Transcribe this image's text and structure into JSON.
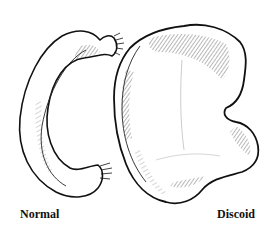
{
  "figure": {
    "style": "black ink line drawing with cross-hatching on white",
    "items": [
      {
        "id": "normal",
        "label": "Normal",
        "shape": "C-shaped crescent meniscus"
      },
      {
        "id": "discoid",
        "label": "Discoid",
        "shape": "broad disc-shaped meniscus"
      }
    ]
  },
  "labels": {
    "normal": "Normal",
    "discoid": "Discoid"
  },
  "colors": {
    "ink": "#111111",
    "background": "#ffffff",
    "hatch": "#333333"
  }
}
